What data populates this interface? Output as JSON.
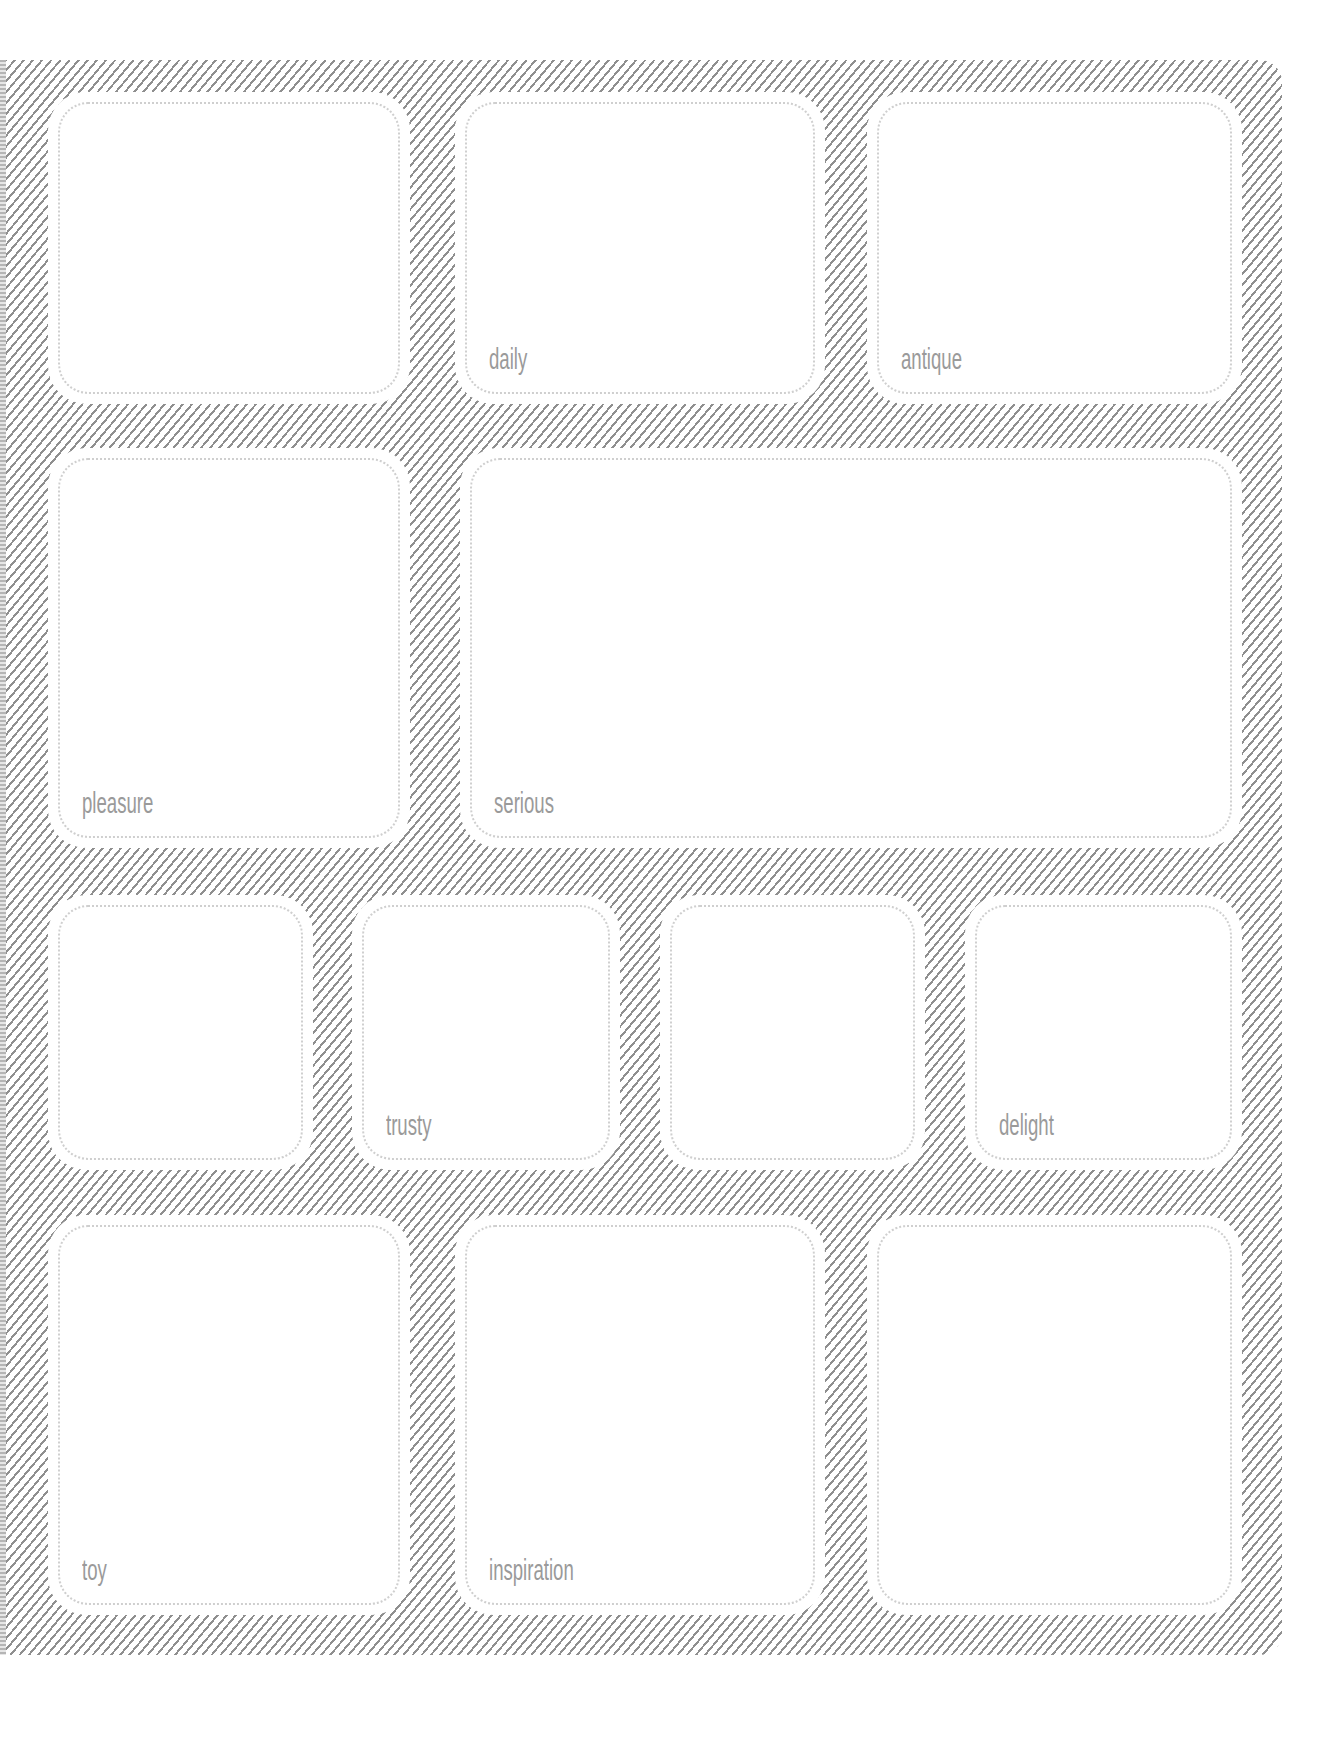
{
  "page": {
    "background_color": "#ffffff",
    "hatch_color": "#8f8f8f",
    "label_color": "#9a9a9a",
    "dotted_border_color": "#cfcfcf"
  },
  "boxes": [
    {
      "id": "r1c1",
      "label": "",
      "x": 48,
      "y": 92,
      "w": 362,
      "h": 312
    },
    {
      "id": "r1c2",
      "label": "daily",
      "x": 455,
      "y": 92,
      "w": 370,
      "h": 312
    },
    {
      "id": "r1c3",
      "label": "antique",
      "x": 867,
      "y": 92,
      "w": 375,
      "h": 312
    },
    {
      "id": "r2c1",
      "label": "pleasure",
      "x": 48,
      "y": 448,
      "w": 362,
      "h": 400
    },
    {
      "id": "r2c2",
      "label": "serious",
      "x": 460,
      "y": 448,
      "w": 782,
      "h": 400
    },
    {
      "id": "r3c1",
      "label": "",
      "x": 48,
      "y": 895,
      "w": 265,
      "h": 275
    },
    {
      "id": "r3c2",
      "label": "trusty",
      "x": 352,
      "y": 895,
      "w": 268,
      "h": 275
    },
    {
      "id": "r3c3",
      "label": "",
      "x": 660,
      "y": 895,
      "w": 265,
      "h": 275
    },
    {
      "id": "r3c4",
      "label": "delight",
      "x": 965,
      "y": 895,
      "w": 277,
      "h": 275
    },
    {
      "id": "r4c1",
      "label": "toy",
      "x": 48,
      "y": 1215,
      "w": 362,
      "h": 400
    },
    {
      "id": "r4c2",
      "label": "inspiration",
      "x": 455,
      "y": 1215,
      "w": 370,
      "h": 400
    },
    {
      "id": "r4c3",
      "label": "",
      "x": 867,
      "y": 1215,
      "w": 375,
      "h": 400
    }
  ]
}
